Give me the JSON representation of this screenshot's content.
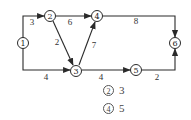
{
  "diagram": {
    "type": "activity-network",
    "nodes": [
      {
        "id": "1",
        "label": "1",
        "x": 23,
        "y": 43
      },
      {
        "id": "2",
        "label": "2",
        "x": 50,
        "y": 16
      },
      {
        "id": "3",
        "label": "3",
        "x": 76,
        "y": 71
      },
      {
        "id": "4",
        "label": "4",
        "x": 97,
        "y": 16
      },
      {
        "id": "5",
        "label": "5",
        "x": 136,
        "y": 70
      },
      {
        "id": "6",
        "label": "6",
        "x": 175,
        "y": 43
      }
    ],
    "edges": [
      {
        "from": "1",
        "to": "2",
        "weight": "3"
      },
      {
        "from": "1",
        "to": "3",
        "weight": "4"
      },
      {
        "from": "2",
        "to": "4",
        "weight": "6"
      },
      {
        "from": "2",
        "to": "3",
        "weight": "2"
      },
      {
        "from": "3",
        "to": "4",
        "weight": "7"
      },
      {
        "from": "4",
        "to": "6",
        "weight": "8"
      },
      {
        "from": "3",
        "to": "5",
        "weight": "4"
      },
      {
        "from": "5",
        "to": "6",
        "weight": "2"
      }
    ]
  },
  "options": [
    {
      "mark": "2",
      "value": "3"
    },
    {
      "mark": "4",
      "value": "5"
    }
  ]
}
